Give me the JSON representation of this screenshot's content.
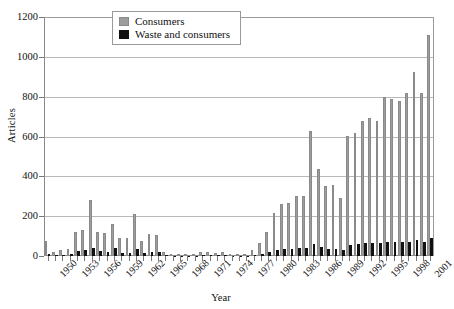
{
  "chart_data": {
    "type": "bar",
    "title": "",
    "xlabel": "Year",
    "ylabel": "Articles",
    "ylim": [
      0,
      1200
    ],
    "yticks": [
      0,
      200,
      400,
      600,
      800,
      1000,
      1200
    ],
    "grid": true,
    "legend_position": "top-center",
    "categories": [
      1950,
      1951,
      1952,
      1953,
      1954,
      1955,
      1956,
      1957,
      1958,
      1959,
      1960,
      1961,
      1962,
      1963,
      1964,
      1965,
      1966,
      1967,
      1968,
      1969,
      1970,
      1971,
      1972,
      1973,
      1974,
      1975,
      1976,
      1977,
      1978,
      1979,
      1980,
      1981,
      1982,
      1983,
      1984,
      1985,
      1986,
      1987,
      1988,
      1989,
      1990,
      1991,
      1992,
      1993,
      1994,
      1995,
      1996,
      1997,
      1998,
      1999,
      2000,
      2001,
      2002
    ],
    "tick_labels": [
      "1950",
      "1953",
      "1956",
      "1959",
      "1962",
      "1965",
      "1968",
      "1971",
      "1974",
      "1977",
      "1980",
      "1983",
      "1986",
      "1989",
      "1992",
      "1995",
      "1998",
      "2001"
    ],
    "series": [
      {
        "name": "Consumers",
        "color": "#9d9d9d",
        "values": [
          75,
          20,
          28,
          35,
          120,
          130,
          280,
          120,
          115,
          160,
          90,
          90,
          210,
          75,
          110,
          105,
          18,
          8,
          6,
          4,
          5,
          18,
          20,
          14,
          22,
          10,
          8,
          10,
          30,
          65,
          120,
          215,
          260,
          265,
          300,
          300,
          630,
          435,
          350,
          355,
          290,
          605,
          620,
          680,
          695,
          680,
          800,
          790,
          780,
          820,
          925,
          820,
          1110
        ]
      },
      {
        "name": "Waste and consumers",
        "color": "#111111",
        "values": [
          10,
          6,
          6,
          8,
          24,
          28,
          40,
          26,
          22,
          40,
          16,
          14,
          34,
          14,
          18,
          18,
          4,
          2,
          2,
          1,
          1,
          3,
          4,
          3,
          4,
          2,
          2,
          2,
          6,
          10,
          18,
          30,
          34,
          34,
          40,
          40,
          58,
          44,
          36,
          36,
          30,
          55,
          60,
          64,
          66,
          64,
          72,
          70,
          68,
          72,
          80,
          72,
          90
        ]
      }
    ]
  },
  "legend": {
    "items": [
      {
        "label": "Consumers",
        "swatch": "gray-swatch"
      },
      {
        "label": "Waste and consumers",
        "swatch": "black-swatch"
      }
    ]
  },
  "axes": {
    "y_title": "Articles",
    "x_title": "Year"
  }
}
